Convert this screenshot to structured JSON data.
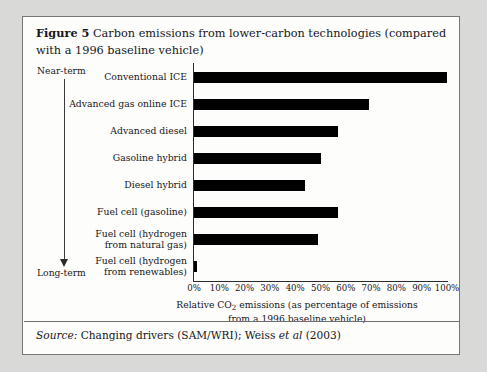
{
  "figure": {
    "label": "Figure 5",
    "caption": "Carbon emissions from lower-carbon technologies (compared with a 1996 baseline vehicle)"
  },
  "annotations": {
    "near_term": "Near-term",
    "long_term": "Long-term",
    "arrow": "down-arrow-icon"
  },
  "source": {
    "prefix": "Source:",
    "text_before_etal": "Changing drivers (SAM/WRI); Weiss",
    "etal": "et al",
    "text_after_etal": "(2003)"
  },
  "axis": {
    "title_line1_a": "Relative CO",
    "title_line1_sub": "2",
    "title_line1_b": " emissions (as percentage of emissions",
    "title_line2": "from a 1996 baseline vehicle)"
  },
  "chart_data": {
    "type": "bar",
    "orientation": "horizontal",
    "title": "Carbon emissions from lower-carbon technologies (compared with a 1996 baseline vehicle)",
    "xlabel": "Relative CO2 emissions (as percentage of emissions from a 1996 baseline vehicle)",
    "ylabel": "",
    "xlim": [
      0,
      100
    ],
    "xticks": [
      "0%",
      "10%",
      "20%",
      "30%",
      "40%",
      "50%",
      "60%",
      "70%",
      "80%",
      "90%",
      "100%"
    ],
    "xtick_values": [
      0,
      10,
      20,
      30,
      40,
      50,
      60,
      70,
      80,
      90,
      100
    ],
    "grid": false,
    "legend": false,
    "bar_color": "#000000",
    "categories": [
      "Conventional ICE",
      "Advanced gas online ICE",
      "Advanced diesel",
      "Gasoline hybrid",
      "Diesel hybrid",
      "Fuel cell (gasoline)",
      "Fuel cell (hydrogen\nfrom natural gas)",
      "Fuel cell (hydrogen\nfrom renewables)"
    ],
    "values": [
      100,
      69,
      57,
      50,
      44,
      57,
      49,
      1
    ]
  }
}
